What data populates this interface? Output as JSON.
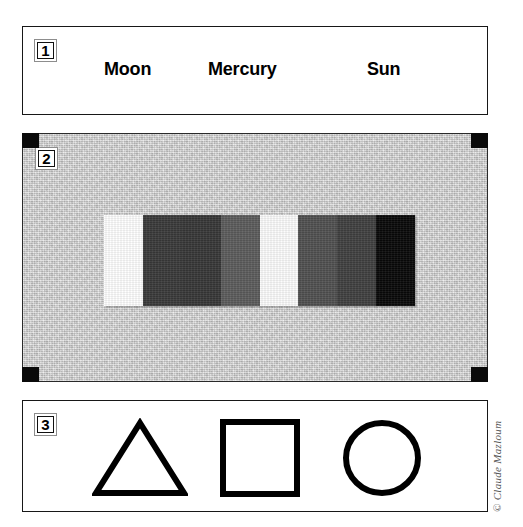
{
  "figure": {
    "background_color": "#ffffff",
    "credit": "© Claude Mazloum"
  },
  "panels": [
    {
      "badge": "1",
      "type": "word-list",
      "words": [
        "Moon",
        "Mercury",
        "Sun"
      ]
    },
    {
      "badge": "2",
      "type": "grayscale-step-wedge",
      "background_color": "#c9c9c9",
      "corner_marker_color": "#0a0a0a",
      "corner_markers": [
        "top-left",
        "top-right",
        "bottom-left",
        "bottom-right"
      ]
    },
    {
      "badge": "3",
      "type": "shape-row",
      "shapes": [
        "triangle",
        "square",
        "circle"
      ],
      "stroke_color": "#000000"
    }
  ],
  "chart_data": {
    "type": "bar",
    "xlabel": "",
    "ylabel": "Reflectance (gray level)",
    "categories": [
      "1",
      "2",
      "3",
      "4",
      "5",
      "6",
      "7",
      "8"
    ],
    "values": [
      255,
      58,
      55,
      92,
      252,
      80,
      64,
      8
    ],
    "ylim": [
      0,
      255
    ],
    "grid": false,
    "legend": "none",
    "colors": [
      "#ffffff",
      "#3a3a3a",
      "#373737",
      "#5c5c5c",
      "#fcfcfc",
      "#505050",
      "#404040",
      "#080808"
    ],
    "annotations": [
      "8 vertical patches of uniform tone, left to right",
      "patch 1 and patch 5 are white, patch 8 is black"
    ]
  }
}
